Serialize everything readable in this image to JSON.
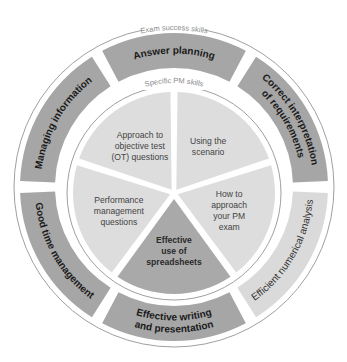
{
  "diagram": {
    "outer_ring_title": "Exam success skills",
    "inner_ring_title": "Specific PM skills",
    "colors": {
      "dark_segment": "#a6a6a6",
      "light_segment": "#dadada",
      "pie_light": "#dddddd",
      "pie_dark": "#a9a9a9",
      "ring_line": "#9a9a9a",
      "background": "#ffffff"
    },
    "outer_segments": [
      {
        "label": "Answer planning",
        "lines": [
          "Answer planning"
        ],
        "shade": "dark"
      },
      {
        "label": "Correct interpretation of requirements",
        "lines": [
          "Correct interpretation",
          "of requirements"
        ],
        "shade": "dark"
      },
      {
        "label": "Efficient numerical analysis",
        "lines": [
          "Efficient numerical analysis"
        ],
        "shade": "light"
      },
      {
        "label": "Effective writing and presentation",
        "lines": [
          "Effective writing",
          "and presentation"
        ],
        "shade": "dark"
      },
      {
        "label": "Good time management",
        "lines": [
          "Good time management"
        ],
        "shade": "dark"
      },
      {
        "label": "Managing information",
        "lines": [
          "Managing information"
        ],
        "shade": "dark"
      }
    ],
    "inner_segments": [
      {
        "label": "Using the scenario",
        "lines": [
          "Using the",
          "scenario"
        ],
        "shade": "light"
      },
      {
        "label": "How to approach your PM exam",
        "lines": [
          "How to",
          "approach",
          "your PM",
          "exam"
        ],
        "shade": "light"
      },
      {
        "label": "Effective use of spreadsheets",
        "lines": [
          "Effective",
          "use of",
          "spreadsheets"
        ],
        "shade": "dark"
      },
      {
        "label": "Performance management questions",
        "lines": [
          "Performance",
          "management",
          "questions"
        ],
        "shade": "light"
      },
      {
        "label": "Approach to objective test (OT) questions",
        "lines": [
          "Approach to",
          "objective test",
          "(OT) questions"
        ],
        "shade": "light"
      }
    ]
  }
}
